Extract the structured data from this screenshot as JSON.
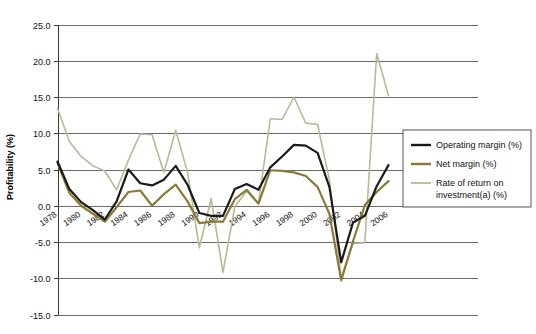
{
  "chart_data": {
    "type": "line",
    "title": "",
    "xlabel": "",
    "ylabel": "Profitability (%)",
    "ylim": [
      -15.0,
      25.0
    ],
    "xlim": [
      1978,
      2006
    ],
    "grid": true,
    "legend_position": "right",
    "y_ticks": [
      "25.0",
      "20.0",
      "15.0",
      "10.0",
      "5.0",
      "0.0",
      "-5.0",
      "-10.0",
      "-15.0"
    ],
    "y_tick_values": [
      25.0,
      20.0,
      15.0,
      10.0,
      5.0,
      0.0,
      -5.0,
      -10.0,
      -15.0
    ],
    "x_tick_labels": [
      "1978",
      "1980",
      "1982",
      "1984",
      "1986",
      "1988",
      "1990",
      "1992",
      "1994",
      "1996",
      "1998",
      "2000",
      "2002",
      "2004",
      "2006"
    ],
    "x_tick_values": [
      1978,
      1980,
      1982,
      1984,
      1986,
      1988,
      1990,
      1992,
      1994,
      1996,
      1998,
      2000,
      2002,
      2004,
      2006
    ],
    "x": [
      1978,
      1979,
      1980,
      1981,
      1982,
      1983,
      1984,
      1985,
      1986,
      1987,
      1988,
      1989,
      1990,
      1991,
      1992,
      1993,
      1994,
      1995,
      1996,
      1997,
      1998,
      1999,
      2000,
      2001,
      2002,
      2003,
      2004,
      2005,
      2006
    ],
    "series": [
      {
        "name": "Operating margin (%)",
        "color": "#1a1a1a",
        "width": 2.2,
        "values": [
          6.1,
          2.3,
          0.5,
          -0.6,
          -1.9,
          0.6,
          5.0,
          3.1,
          2.8,
          3.6,
          5.5,
          2.9,
          -1.0,
          -1.4,
          -1.4,
          2.3,
          3.0,
          2.2,
          5.3,
          6.8,
          8.4,
          8.3,
          7.3,
          2.6,
          -7.8,
          -2.3,
          -1.4,
          2.7,
          5.6
        ]
      },
      {
        "name": "Net margin (%)",
        "color": "#8a7a36",
        "width": 2.2,
        "values": [
          5.9,
          1.8,
          0.0,
          -1.1,
          -2.2,
          -0.2,
          1.9,
          2.1,
          0.0,
          1.6,
          2.9,
          0.6,
          -2.4,
          -2.2,
          -2.2,
          0.9,
          2.2,
          0.3,
          4.9,
          4.8,
          4.6,
          4.1,
          2.6,
          -1.1,
          -10.3,
          -4.9,
          0.1,
          1.9,
          3.4
        ]
      },
      {
        "name": "Rate of return on investment(a) (%)",
        "color": "#b9b897",
        "width": 1.6,
        "values": [
          13.4,
          8.9,
          6.8,
          5.5,
          4.8,
          2.2,
          6.3,
          9.9,
          9.8,
          4.6,
          10.4,
          4.6,
          -5.8,
          1.0,
          -9.2,
          -0.1,
          2.0,
          0.3,
          12.0,
          11.9,
          15.0,
          11.4,
          11.2,
          3.6,
          -10.0,
          -5.2,
          -5.1,
          21.0,
          15.2
        ]
      }
    ]
  },
  "legend": {
    "items": [
      {
        "label": "Operating margin (%)",
        "color": "#1a1a1a"
      },
      {
        "label": "Net margin (%)",
        "color": "#8a7a36"
      },
      {
        "label": "Rate of return on",
        "label2": "investment(a) (%)",
        "color": "#b9b897"
      }
    ]
  }
}
